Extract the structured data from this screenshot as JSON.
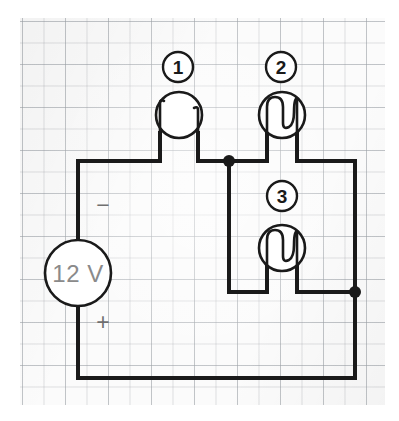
{
  "diagram": {
    "type": "circuit-schematic",
    "background": {
      "name": "graph-paper",
      "paper_color": "#fbfbfb",
      "grid_color": "#b2b7bc",
      "minor_cell_px": 21.5,
      "major_cell_px": 43
    },
    "colors": {
      "wire": "#1a1a1a",
      "component_outline": "#1a1a1a",
      "component_fill": "#ffffff",
      "source_label_text": "#8a8a8a",
      "polarity_text": "#6f6f6f",
      "tag_text": "#1a1a1a"
    },
    "source": {
      "name": "voltage-source",
      "value": "12 V",
      "minus_label": "−",
      "plus_label": "+",
      "minus_side": "top",
      "plus_side": "bottom"
    },
    "lamps": [
      {
        "tag": "1",
        "name": "lamp-1",
        "state": "broken-filament",
        "position": "top-left-branch"
      },
      {
        "tag": "2",
        "name": "lamp-2",
        "state": "intact-filament",
        "position": "top-right-branch"
      },
      {
        "tag": "3",
        "name": "lamp-3",
        "state": "intact-filament",
        "position": "lower-right-branch"
      }
    ],
    "nodes": [
      {
        "name": "junction-left",
        "label": ""
      },
      {
        "name": "junction-right",
        "label": ""
      }
    ]
  }
}
